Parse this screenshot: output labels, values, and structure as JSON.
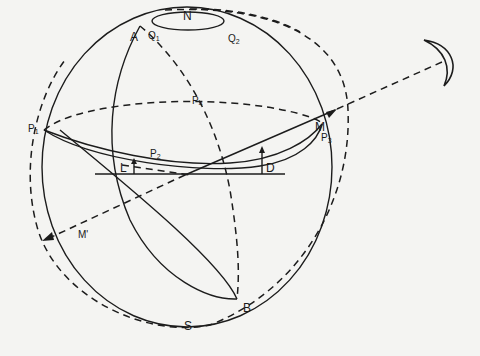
{
  "diagram": {
    "type": "celestial-sphere",
    "labels": {
      "north_pole": "N",
      "south_pole": "S",
      "point_a": "A",
      "point_b": "B",
      "q1": "Q",
      "q1_sub": "1",
      "q2": "Q",
      "q2_sub": "2",
      "p1": "P",
      "p1_sub": "1",
      "p2": "P",
      "p2_sub": "2",
      "p3": "P",
      "p3_sub": "3",
      "p4": "P",
      "p4_sub": "4",
      "moon_point": "M",
      "antipode_point": "M'",
      "angle_l": "L",
      "angle_d": "D"
    },
    "icons": {
      "moon": "crescent-moon"
    },
    "colors": {
      "ink": "#1c1c1c",
      "paper": "#f4f4f2"
    }
  }
}
